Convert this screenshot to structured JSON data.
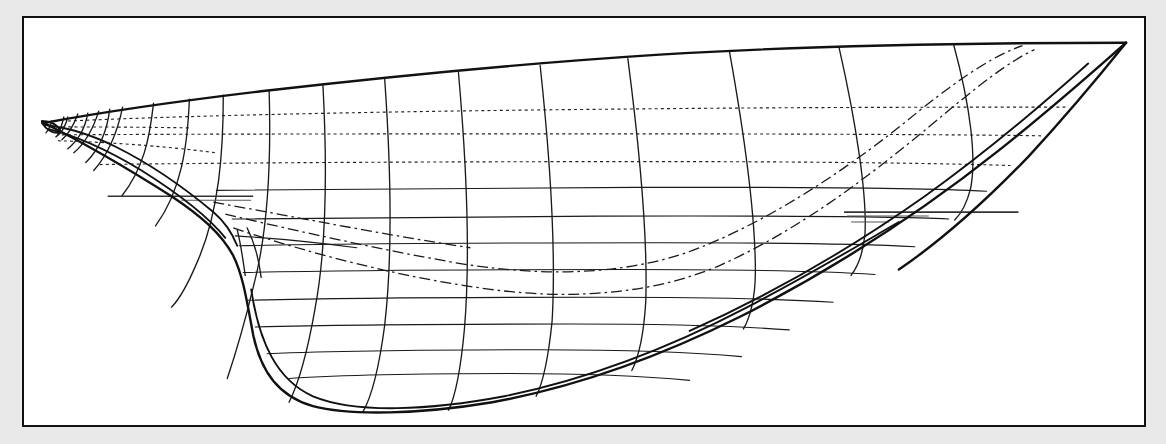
{
  "figure": {
    "kind": "naval-architecture-lines-plan",
    "view": "sheer-profile",
    "title": "",
    "caption": "",
    "background_color": "#e9e9e9",
    "sheet_color": "#ffffff",
    "ink_color": "#111111",
    "frame": {
      "x": 22,
      "y": 16,
      "width": 1124,
      "height": 411,
      "stroke": "#111111",
      "stroke_width": 2
    }
  },
  "chart_data": {
    "type": "line",
    "title": "",
    "xlabel": "",
    "ylabel": "",
    "grid": false,
    "legend": "none",
    "xlim": [
      22,
      1146
    ],
    "ylim": [
      16,
      427
    ],
    "notes": "Hull lines plan: sheer (profile) view. Bow at left, stern at right. Curves are hull outline, transverse station sections, horizontal waterlines and dash-dot diagonals.",
    "series": [
      {
        "name": "deck-sheer-line",
        "style": "solid-heavy",
        "points": [
          [
            40,
            121
          ],
          [
            78,
            112
          ],
          [
            140,
            103
          ],
          [
            230,
            93
          ],
          [
            330,
            83
          ],
          [
            440,
            73
          ],
          [
            560,
            63
          ],
          [
            680,
            54
          ],
          [
            800,
            47
          ],
          [
            920,
            44
          ],
          [
            1020,
            42
          ],
          [
            1128,
            42
          ]
        ]
      },
      {
        "name": "stem-and-keel-profile",
        "style": "solid-heavy",
        "points": [
          [
            40,
            121
          ],
          [
            60,
            130
          ],
          [
            95,
            146
          ],
          [
            140,
            168
          ],
          [
            185,
            192
          ],
          [
            215,
            208
          ],
          [
            232,
            225
          ],
          [
            243,
            252
          ],
          [
            250,
            286
          ],
          [
            258,
            330
          ],
          [
            272,
            372
          ],
          [
            300,
            398
          ],
          [
            345,
            410
          ],
          [
            400,
            413
          ],
          [
            470,
            410
          ],
          [
            545,
            396
          ],
          [
            620,
            374
          ],
          [
            700,
            340
          ],
          [
            780,
            300
          ],
          [
            860,
            256
          ],
          [
            940,
            208
          ],
          [
            1010,
            160
          ],
          [
            1070,
            110
          ],
          [
            1110,
            65
          ],
          [
            1128,
            42
          ]
        ]
      },
      {
        "name": "bow-knuckle-inner",
        "style": "solid",
        "points": [
          [
            41,
            123
          ],
          [
            70,
            126
          ],
          [
            100,
            134
          ],
          [
            135,
            150
          ],
          [
            170,
            170
          ],
          [
            200,
            190
          ],
          [
            220,
            206
          ],
          [
            232,
            222
          ]
        ]
      },
      {
        "name": "forefoot-fairing",
        "style": "solid",
        "points": [
          [
            44,
            126
          ],
          [
            80,
            135
          ],
          [
            120,
            152
          ],
          [
            165,
            176
          ],
          [
            200,
            196
          ],
          [
            222,
            212
          ],
          [
            234,
            228
          ]
        ]
      },
      {
        "name": "stern-transom-edge",
        "style": "solid",
        "points": [
          [
            1128,
            42
          ],
          [
            1112,
            58
          ],
          [
            1090,
            84
          ],
          [
            1060,
            118
          ],
          [
            1030,
            150
          ],
          [
            1000,
            182
          ],
          [
            965,
            214
          ],
          [
            930,
            242
          ],
          [
            900,
            262
          ]
        ]
      },
      {
        "name": "bottom-rocker",
        "style": "solid",
        "points": [
          [
            250,
            288
          ],
          [
            272,
            352
          ],
          [
            300,
            390
          ],
          [
            350,
            407
          ],
          [
            410,
            410
          ],
          [
            480,
            403
          ],
          [
            560,
            385
          ],
          [
            640,
            356
          ],
          [
            720,
            320
          ],
          [
            800,
            282
          ],
          [
            880,
            244
          ],
          [
            900,
            232
          ]
        ]
      }
    ],
    "stations": {
      "count": 14,
      "x_positions": [
        65,
        96,
        130,
        172,
        220,
        268,
        320,
        382,
        458,
        540,
        628,
        730,
        840,
        955
      ],
      "style": "solid"
    },
    "waterlines": {
      "dotted_y": [
        107,
        133,
        162
      ],
      "solid_y": [
        188,
        217,
        245,
        272,
        300,
        327,
        353,
        378
      ],
      "count": 11
    },
    "diagonals": {
      "count": 2,
      "style": "dash-dot",
      "description": "two long dash-dot diagonal curves running from forefoot up aft toward the quarter"
    },
    "reference_lines": [
      {
        "name": "design-waterline-fwd-extension",
        "x1": 106,
        "x2": 252,
        "y": 196
      },
      {
        "name": "design-waterline-aft-extension",
        "x1": 845,
        "x2": 1020,
        "y": 212
      }
    ]
  },
  "annotations": {
    "bow_label": "",
    "stern_label": "",
    "scale_label": ""
  }
}
